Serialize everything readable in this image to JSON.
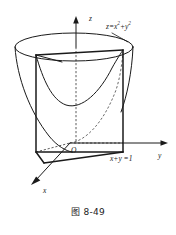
{
  "figure": {
    "caption": "图 8-49",
    "background_color": "#ffffff",
    "ink_color": "#1a1a1a"
  },
  "axes": {
    "z_label": "z",
    "y_label": "y",
    "x_label": "x",
    "origin_label": "O"
  },
  "labels": {
    "surface_equation_base": "z=x",
    "surface_equation_exp1": "2",
    "surface_equation_mid": "+y",
    "surface_equation_exp2": "2",
    "surface_equation_plain": "z=x2+y2",
    "plane_equation": "x+y =1"
  },
  "geometry": {
    "top_ellipse": {
      "center_x": 74,
      "center_y": 47,
      "radius_x": 59,
      "radius_y": 14
    },
    "origin_point": {
      "x": 70,
      "y": 143
    },
    "z_axis": {
      "x": 76,
      "y_top": 18,
      "y_bottom": 143
    },
    "y_axis": {
      "x_start": 70,
      "x_end": 168,
      "y": 143
    },
    "x_axis": {
      "x_start": 70,
      "y_start": 143,
      "x_end": 30,
      "y_end": 186
    },
    "left_wall_x": 36,
    "right_wall_x": 123,
    "wall_top_y": 55,
    "wall_bottom_y": 152
  }
}
